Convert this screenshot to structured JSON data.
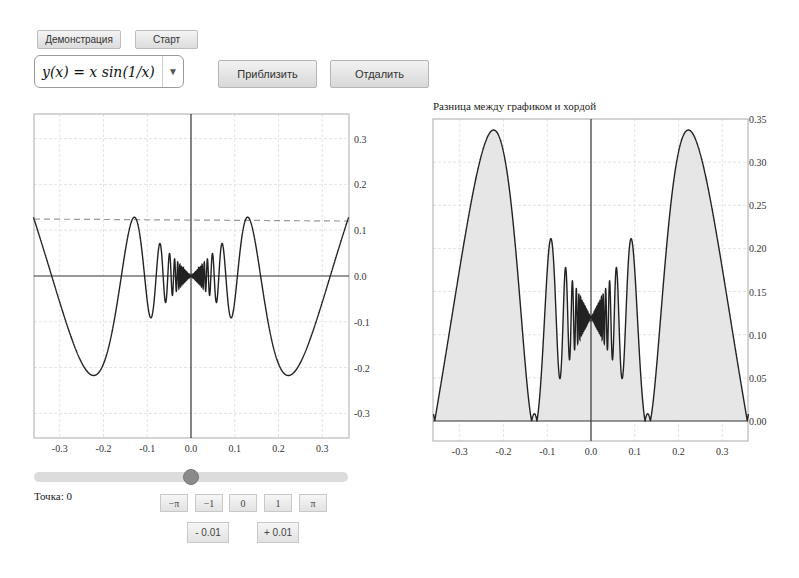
{
  "toolbar": {
    "demo_label": "Демонстрация",
    "start_label": "Старт",
    "function_select": {
      "selected": "y(x) = x sin(1/x)",
      "arrow": "▼"
    },
    "zoom_in_label": "Приблизить",
    "zoom_out_label": "Отдалить"
  },
  "right_plot": {
    "title": "Разница между графиком и хордой"
  },
  "controls": {
    "point_label": "Точка: 0",
    "slider_value": 0,
    "buttons": [
      "−π",
      "−1",
      "0",
      "1",
      "π"
    ],
    "step_buttons": [
      "- 0.01",
      "+ 0.01"
    ]
  },
  "colors": {
    "curve": "#222222",
    "fill": "#e6e6e6",
    "grid": "#e3e3e3",
    "dashed": "#9a9a9a",
    "thumb": "#8a8a8a"
  },
  "chart_data": [
    {
      "type": "line",
      "title": "",
      "function": "x*sin(1/x)",
      "xlabel": "",
      "ylabel": "",
      "xlim": [
        -0.36,
        0.36
      ],
      "ylim": [
        -0.36,
        0.35
      ],
      "xticks": [
        "-0.3",
        "-0.2",
        "-0.1",
        "0.0",
        "0.1",
        "0.2",
        "0.3"
      ],
      "yticks": [
        "0.3",
        "0.2",
        "0.1",
        "0.0",
        "-0.1",
        "-0.2",
        "-0.3"
      ],
      "chord_y": 0.12,
      "grid": true,
      "annotations": [
        "dashed horizontal chord at y≈0.12"
      ]
    },
    {
      "type": "area",
      "title": "Разница между графиком и хордой",
      "function": "|x*sin(1/x) - 0.12|",
      "xlim": [
        -0.36,
        0.36
      ],
      "ylim": [
        -0.045,
        0.35
      ],
      "xticks": [
        "-0.3",
        "-0.2",
        "-0.1",
        "0.0",
        "0.1",
        "0.2",
        "0.3"
      ],
      "yticks": [
        "0.35",
        "0.30",
        "0.25",
        "0.20",
        "0.15",
        "0.10",
        "0.05",
        "0.00"
      ],
      "grid": true
    }
  ]
}
